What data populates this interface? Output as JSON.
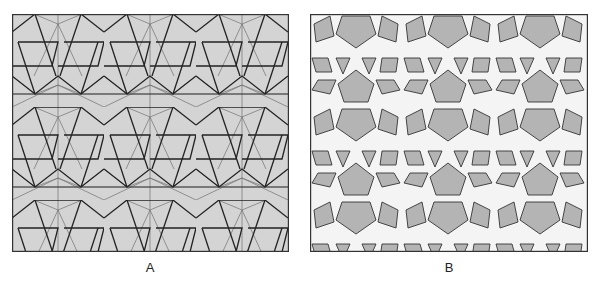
{
  "figure": {
    "panels": [
      {
        "id": "A",
        "label": "A",
        "description": "Construction grid of a geometric star pattern: gray background with thin construction lines and bold pattern lines forming trapezoids and zigzags",
        "background_color": "#d4d4d4",
        "line_color_bold": "#222222",
        "line_color_thin": "#6a6a6a"
      },
      {
        "id": "B",
        "label": "B",
        "description": "Interlaced strapwork version of the pattern: white bands with gray pentagons, kites, rhombi and triangles",
        "band_color": "#f4f4f4",
        "fill_color": "#b4b4b4",
        "outline_color": "#333333"
      }
    ]
  }
}
